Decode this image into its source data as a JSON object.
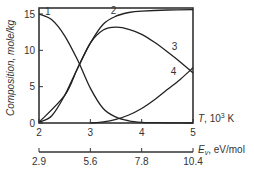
{
  "chart_data": {
    "type": "line",
    "title": "",
    "ylabel": "Composition, mole/kg",
    "xlabel": "T, 10^3 K",
    "xlabel_italic": "T",
    "xlabel_rest": ", 10",
    "xlabel_sup": "3",
    "xlabel_unit": " K",
    "x2label_italic": "E",
    "x2label_sub": "v",
    "x2label_rest": ", eV/mol",
    "xlim": [
      2,
      5
    ],
    "ylim": [
      0,
      15.8
    ],
    "xticks": [
      "2",
      "3",
      "4",
      "5"
    ],
    "yticks": [
      "0",
      "5",
      "10",
      "15"
    ],
    "x2ticks": [
      "2.9",
      "5.6",
      "7.8",
      "10.4"
    ],
    "grid": false,
    "series": [
      {
        "name": "1",
        "x": [
          2.0,
          2.25,
          2.5,
          2.75,
          3.0,
          3.25,
          3.5,
          3.75,
          4.0,
          4.25,
          4.5,
          5.0
        ],
        "y": [
          15.0,
          14.2,
          12.0,
          8.7,
          4.8,
          2.0,
          0.8,
          0.3,
          0.1,
          0.05,
          0.02,
          0.0
        ]
      },
      {
        "name": "2",
        "x": [
          2.0,
          2.25,
          2.5,
          2.75,
          3.0,
          3.25,
          3.5,
          3.75,
          4.0,
          4.5,
          5.0
        ],
        "y": [
          0.1,
          1.0,
          3.8,
          7.5,
          11.0,
          13.6,
          14.7,
          15.2,
          15.4,
          15.55,
          15.6
        ]
      },
      {
        "name": "3",
        "x": [
          2.0,
          2.5,
          2.75,
          3.0,
          3.25,
          3.5,
          3.75,
          4.0,
          4.25,
          4.5,
          4.75,
          5.0
        ],
        "y": [
          0.1,
          3.8,
          7.5,
          11.0,
          12.8,
          13.2,
          12.9,
          12.2,
          11.1,
          9.8,
          8.4,
          6.9
        ]
      },
      {
        "name": "4",
        "x": [
          3.0,
          3.25,
          3.5,
          3.75,
          4.0,
          4.25,
          4.5,
          4.75,
          5.0
        ],
        "y": [
          0.0,
          0.15,
          0.5,
          1.1,
          2.0,
          3.2,
          4.6,
          6.0,
          7.6
        ]
      }
    ],
    "curve_labels": [
      {
        "text": "1",
        "x": 2.17,
        "y": 14.9
      },
      {
        "text": "2",
        "x": 3.45,
        "y": 15.0
      },
      {
        "text": "3",
        "x": 4.64,
        "y": 10.1
      },
      {
        "text": "4",
        "x": 4.62,
        "y": 6.6
      }
    ],
    "legend": "none (inline numeric labels)"
  }
}
